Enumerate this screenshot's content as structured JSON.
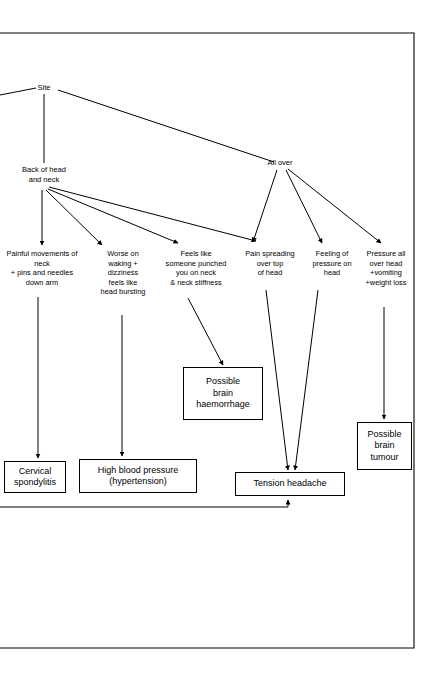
{
  "diagram": {
    "page_border": {
      "color": "#000000"
    },
    "root": {
      "id": "site",
      "label": "Site"
    },
    "branches": [
      {
        "id": "back-of-head-and-neck",
        "label": "Back of head\nand neck"
      },
      {
        "id": "all-over",
        "label": "All over"
      }
    ],
    "symptoms": [
      {
        "id": "painful-movements-of-neck",
        "label": "Painful movements of\nneck\n+ pins and needles\ndown arm",
        "from": "back-of-head-and-neck",
        "to": "cervical-spondylitis"
      },
      {
        "id": "worse-on-waking",
        "label": "Worse on\nwaking +\ndizziness\nfeels like\nhead bursting",
        "from": "back-of-head-and-neck",
        "to": "high-blood-pressure"
      },
      {
        "id": "feels-like-someone-punched",
        "label": "Feels like\nsomeone punched\nyou on neck\n& neck stiffness",
        "from": "back-of-head-and-neck",
        "to": "possible-brain-haemorrhage"
      },
      {
        "id": "pain-spreading-over-top-of-head",
        "label": "Pain spreading\nover top\nof head",
        "from": "back-of-head-and-neck",
        "to": "tension-headache"
      },
      {
        "id": "feeling-of-pressure-on-head",
        "label": "Feeling of\npressure on\nhead",
        "from": "all-over",
        "to": "tension-headache"
      },
      {
        "id": "pressure-all-over-head",
        "label": "Pressure all\nover head\n+vomiting\n+weight loss",
        "from": "all-over",
        "to": "possible-brain-tumour"
      }
    ],
    "diagnoses": [
      {
        "id": "cervical-spondylitis",
        "label": "Cervical\nspondylitis"
      },
      {
        "id": "high-blood-pressure",
        "label": "High blood pressure\n(hypertension)"
      },
      {
        "id": "possible-brain-haemorrhage",
        "label": "Possible\nbrain\nhaemorrhage"
      },
      {
        "id": "tension-headache",
        "label": "Tension headache"
      },
      {
        "id": "possible-brain-tumour",
        "label": "Possible\nbrain\ntumour"
      }
    ]
  }
}
